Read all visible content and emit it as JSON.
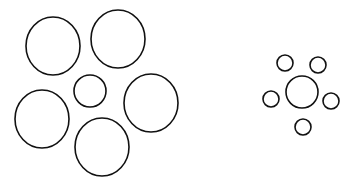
{
  "stroke_color": "#111111",
  "background": "#ffffff",
  "left_group": {
    "center": {
      "cx": 90,
      "cy": 91,
      "rx": 16,
      "ry": 16
    },
    "surround": [
      {
        "cx": 53,
        "cy": 46,
        "rx": 27,
        "ry": 29
      },
      {
        "cx": 118,
        "cy": 39,
        "rx": 27,
        "ry": 29
      },
      {
        "cx": 151,
        "cy": 103,
        "rx": 27,
        "ry": 29
      },
      {
        "cx": 102,
        "cy": 147,
        "rx": 27,
        "ry": 29
      },
      {
        "cx": 42,
        "cy": 119,
        "rx": 27,
        "ry": 29
      }
    ]
  },
  "right_group": {
    "center": {
      "cx": 302,
      "cy": 92,
      "rx": 16,
      "ry": 16
    },
    "surround": [
      {
        "cx": 285,
        "cy": 63,
        "rx": 8,
        "ry": 8
      },
      {
        "cx": 318,
        "cy": 65,
        "rx": 8,
        "ry": 8
      },
      {
        "cx": 331,
        "cy": 101,
        "rx": 8,
        "ry": 8
      },
      {
        "cx": 303,
        "cy": 127,
        "rx": 8,
        "ry": 8
      },
      {
        "cx": 271,
        "cy": 99,
        "rx": 8,
        "ry": 8
      }
    ]
  }
}
